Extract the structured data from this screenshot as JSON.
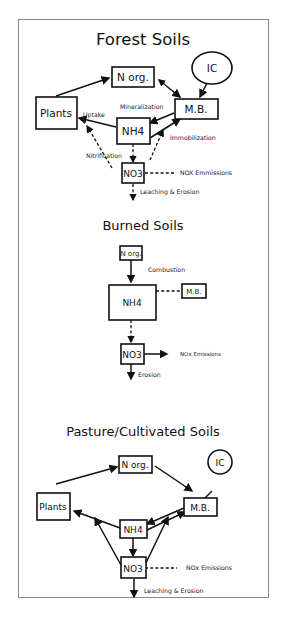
{
  "diagram": {
    "type": "nitrogen-cycle-comparison",
    "panels": [
      {
        "title": "Forest Soils",
        "nodes": {
          "n_org": "N org.",
          "ic": "IC",
          "plants": "Plants",
          "mb": "M.B.",
          "nh4": "NH4",
          "no3": "NO3"
        },
        "labels": {
          "uptake": "Uptake",
          "mineralization": "Mineralization",
          "immobilization": "Immobilization",
          "nitrification": "Nitrification",
          "emissions": "NOX Emmissions",
          "leaching": "Leaching & Erosion"
        }
      },
      {
        "title": "Burned Soils",
        "nodes": {
          "n_org": "N org.",
          "nh4": "NH4",
          "mb": "M.B.",
          "no3": "NO3"
        },
        "labels": {
          "combustion": "Combustion",
          "emissions": "NOx Emissions",
          "erosion": "Erosion"
        }
      },
      {
        "title": "Pasture/Cultivated Soils",
        "nodes": {
          "n_org": "N org.",
          "ic": "IC",
          "plants": "Plants",
          "mb": "M.B.",
          "nh4": "NH4",
          "no3": "NO3"
        },
        "labels": {
          "emissions": "NOx Emissions",
          "leaching": "Leaching & Erosion"
        }
      }
    ]
  }
}
